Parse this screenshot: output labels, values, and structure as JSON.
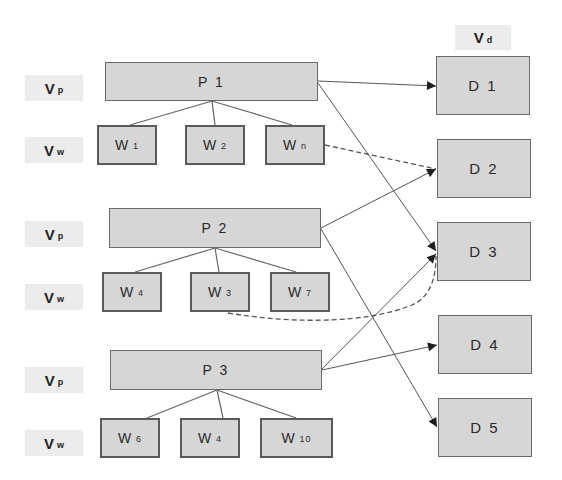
{
  "labels": {
    "vp": {
      "main": "V",
      "sub": "p"
    },
    "vw": {
      "main": "V",
      "sub": "w"
    },
    "vd": {
      "main": "V",
      "sub": "d"
    }
  },
  "processes": [
    {
      "id": "P1",
      "label": "P 1",
      "workers": [
        {
          "main": "W",
          "sub": "1"
        },
        {
          "main": "W",
          "sub": "2"
        },
        {
          "main": "W",
          "sub": "n"
        }
      ]
    },
    {
      "id": "P2",
      "label": "P 2",
      "workers": [
        {
          "main": "W",
          "sub": "4"
        },
        {
          "main": "W",
          "sub": "3"
        },
        {
          "main": "W",
          "sub": "7"
        }
      ]
    },
    {
      "id": "P3",
      "label": "P 3",
      "workers": [
        {
          "main": "W",
          "sub": "6"
        },
        {
          "main": "W",
          "sub": "4"
        },
        {
          "main": "W",
          "sub": "10"
        }
      ]
    }
  ],
  "destinations": [
    {
      "id": "D1",
      "label": "D 1"
    },
    {
      "id": "D2",
      "label": "D 2"
    },
    {
      "id": "D3",
      "label": "D 3"
    },
    {
      "id": "D4",
      "label": "D 4"
    },
    {
      "id": "D5",
      "label": "D 5"
    }
  ],
  "edges": [
    {
      "from": "P1",
      "to": "D1",
      "style": "solid"
    },
    {
      "from": "P1",
      "to": "D3",
      "style": "solid"
    },
    {
      "from": "Wn",
      "to": "D2",
      "style": "dashed"
    },
    {
      "from": "P2",
      "to": "D2",
      "style": "solid"
    },
    {
      "from": "P2",
      "to": "D5",
      "style": "solid"
    },
    {
      "from": "W3",
      "to": "D3",
      "style": "dashed"
    },
    {
      "from": "P3",
      "to": "D3",
      "style": "solid"
    },
    {
      "from": "P3",
      "to": "D4",
      "style": "solid"
    }
  ],
  "colors": {
    "box_fill": "#d6d6d6",
    "box_border": "#6a6a6a",
    "line": "#555555",
    "label_bg": "#ececec"
  }
}
